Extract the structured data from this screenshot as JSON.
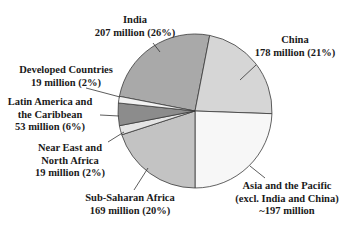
{
  "chart_data": {
    "type": "pie",
    "title": "",
    "unit": "million",
    "slices": [
      {
        "name": "India",
        "value": 207,
        "percent": 26,
        "color": "#a9a9a9"
      },
      {
        "name": "China",
        "value": 178,
        "percent": 21,
        "color": "#d6d6d6"
      },
      {
        "name": "Asia and the Pacific (excl. India and China)",
        "value": 197,
        "percent": null,
        "color": "#f7f7f7"
      },
      {
        "name": "Sub-Saharan Africa",
        "value": 169,
        "percent": 20,
        "color": "#c3c3c3"
      },
      {
        "name": "Near East and North Africa",
        "value": 19,
        "percent": 2,
        "color": "#e4e4e4"
      },
      {
        "name": "Latin America and the Caribbean",
        "value": 53,
        "percent": 6,
        "color": "#8c8c8c"
      },
      {
        "name": "Developed Countries",
        "value": 19,
        "percent": 2,
        "color": "#f2f2f2"
      }
    ],
    "slice_angles_deg": [
      {
        "name": "India",
        "start": -169,
        "end": -79
      },
      {
        "name": "China",
        "start": -79,
        "end": 2
      },
      {
        "name": "Asia and the Pacific (excl. India and China)",
        "start": 2,
        "end": 90
      },
      {
        "name": "Sub-Saharan Africa",
        "start": 90,
        "end": 162
      },
      {
        "name": "Near East and North Africa",
        "start": 162,
        "end": 169
      },
      {
        "name": "Latin America and the Caribbean",
        "start": 169,
        "end": 186
      },
      {
        "name": "Developed Countries",
        "start": 186,
        "end": 191
      }
    ]
  },
  "labels": {
    "india": {
      "line1": "India",
      "line2": "207 million (26%)"
    },
    "china": {
      "line1": "China",
      "line2": "178 million (21%)"
    },
    "developed": {
      "line1": "Developed Countries",
      "line2": "19 million (2%)"
    },
    "latam": {
      "line1": "Latin America and",
      "line2": "the Caribbean",
      "line3": "53 million (6%)"
    },
    "neareast": {
      "line1": "Near East and",
      "line2": "North Africa",
      "line3": "19 million (2%)"
    },
    "ssafrica": {
      "line1": "Sub-Saharan Africa",
      "line2": "169 million (20%)"
    },
    "asia": {
      "line1": "Asia and the Pacific",
      "line2": "(excl. India and China)",
      "line3": "~197 million"
    }
  }
}
